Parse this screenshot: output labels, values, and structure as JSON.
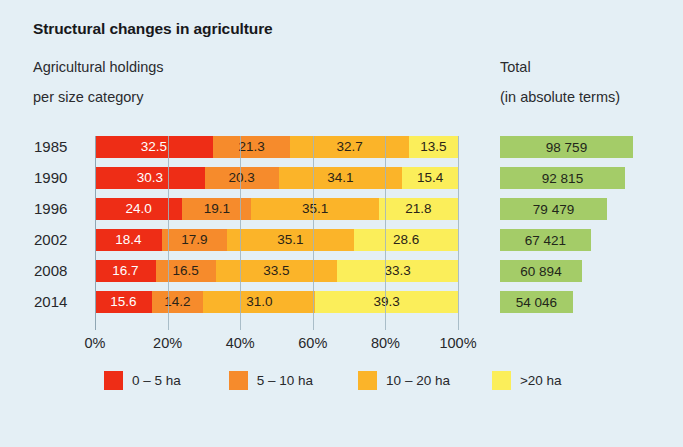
{
  "header": {
    "title": "Structural changes in agriculture",
    "subtitle_line1": "Agricultural holdings",
    "subtitle_line2": "per size category",
    "total_line1": "Total",
    "total_line2": "(in absolute terms)"
  },
  "legend": [
    {
      "label": "0 – 5 ha",
      "color": "#ee2d16"
    },
    {
      "label": "5 – 10 ha",
      "color": "#f68b2c"
    },
    {
      "label": "10 – 20 ha",
      "color": "#fbb429"
    },
    {
      "label": ">20 ha",
      "color": "#fbee5a"
    }
  ],
  "chart_data": {
    "type": "bar",
    "subtype": "stacked-horizontal-100pct",
    "title": "Structural changes in agriculture",
    "subtitle": "Agricultural holdings per size category",
    "xlabel": "",
    "ylabel": "",
    "xlim": [
      0,
      100
    ],
    "grid": true,
    "legend_position": "bottom",
    "xtick_labels": [
      "0%",
      "20%",
      "40%",
      "60%",
      "80%",
      "100%"
    ],
    "xtick_values": [
      0,
      20,
      40,
      60,
      80,
      100
    ],
    "categories": [
      "1985",
      "1990",
      "1996",
      "2002",
      "2008",
      "2014"
    ],
    "series": [
      {
        "name": "0 – 5 ha",
        "color": "#ee2d16",
        "values": [
          32.5,
          30.3,
          24.0,
          18.4,
          16.7,
          15.6
        ]
      },
      {
        "name": "5 – 10 ha",
        "color": "#f68b2c",
        "values": [
          21.3,
          20.3,
          19.1,
          17.9,
          16.5,
          14.2
        ]
      },
      {
        "name": "10 – 20 ha",
        "color": "#fbb429",
        "values": [
          32.7,
          34.1,
          35.1,
          35.1,
          33.5,
          31.0
        ]
      },
      {
        "name": ">20 ha",
        "color": "#fbee5a",
        "values": [
          13.5,
          15.4,
          21.8,
          28.6,
          33.3,
          39.3
        ]
      }
    ],
    "value_labels": [
      [
        "32.5",
        "21.3",
        "32.7",
        "13.5"
      ],
      [
        "30.3",
        "20.3",
        "34.1",
        "15.4"
      ],
      [
        "24.0",
        "19.1",
        "35.1",
        "21.8"
      ],
      [
        "18.4",
        "17.9",
        "35.1",
        "28.6"
      ],
      [
        "16.7",
        "16.5",
        "33.5",
        "33.3"
      ],
      [
        "15.6",
        "14.2",
        "31.0",
        "39.3"
      ]
    ]
  },
  "totals_chart": {
    "type": "bar",
    "subtype": "horizontal",
    "title": "Total (in absolute terms)",
    "color": "#a4cc68",
    "categories": [
      "1985",
      "1990",
      "1996",
      "2002",
      "2008",
      "2014"
    ],
    "values": [
      98759,
      92815,
      79479,
      67421,
      60894,
      54046
    ],
    "labels": [
      "98 759",
      "92 815",
      "79 479",
      "67 421",
      "60 894",
      "54 046"
    ]
  },
  "colors": {
    "background": "#e4eff5",
    "text": "#27282b",
    "gridline": "#9fb4c0",
    "size_0_5": "#ee2d16",
    "size_5_10": "#f68b2c",
    "size_10_20": "#fbb429",
    "size_20_plus": "#fbee5a",
    "total_green": "#a4cc68"
  }
}
